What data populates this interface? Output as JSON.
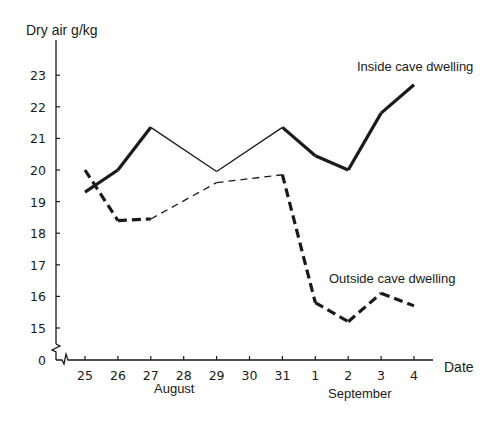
{
  "chart_data": {
    "type": "line",
    "title": "",
    "ylabel": "Dry air g/kg",
    "xlabel": "Date",
    "x": [
      "25",
      "26",
      "27",
      "28",
      "29",
      "30",
      "31",
      "1",
      "2",
      "3",
      "4"
    ],
    "month_labels": [
      {
        "label": "August",
        "under": [
          "25",
          "26",
          "27",
          "28",
          "29",
          "30"
        ]
      },
      {
        "label": "September",
        "under": [
          "31",
          "1",
          "2",
          "3",
          "4"
        ]
      }
    ],
    "yticks": [
      "0",
      "15",
      "16",
      "17",
      "18",
      "19",
      "20",
      "21",
      "22",
      "23"
    ],
    "ylim": [
      15,
      23
    ],
    "y_axis_break": "between 0 and 15",
    "grid": false,
    "legend": "direct labels on lines",
    "series": [
      {
        "name": "Inside cave dwelling",
        "style": "solid",
        "values": [
          19.3,
          20.0,
          21.35,
          null,
          19.95,
          null,
          21.35,
          20.45,
          20.0,
          21.8,
          22.7
        ],
        "note": "thin interpolated segments between 27-29 and 29-31"
      },
      {
        "name": "Outside cave dwelling",
        "style": "dashed",
        "values": [
          20.0,
          18.4,
          18.45,
          null,
          19.6,
          null,
          19.85,
          15.8,
          15.2,
          16.1,
          15.7
        ],
        "note": "thin interpolated segments between 27-29 and 29-31"
      }
    ]
  },
  "labels": {
    "y_axis_title": "Dry air g/kg",
    "x_axis_title": "Date",
    "inside_series_label": "Inside cave dwelling",
    "outside_series_label": "Outside cave dwelling",
    "month_august": "August",
    "month_september": "September"
  },
  "colors": {
    "ink": "#1a1a1a",
    "background": "#ffffff"
  }
}
